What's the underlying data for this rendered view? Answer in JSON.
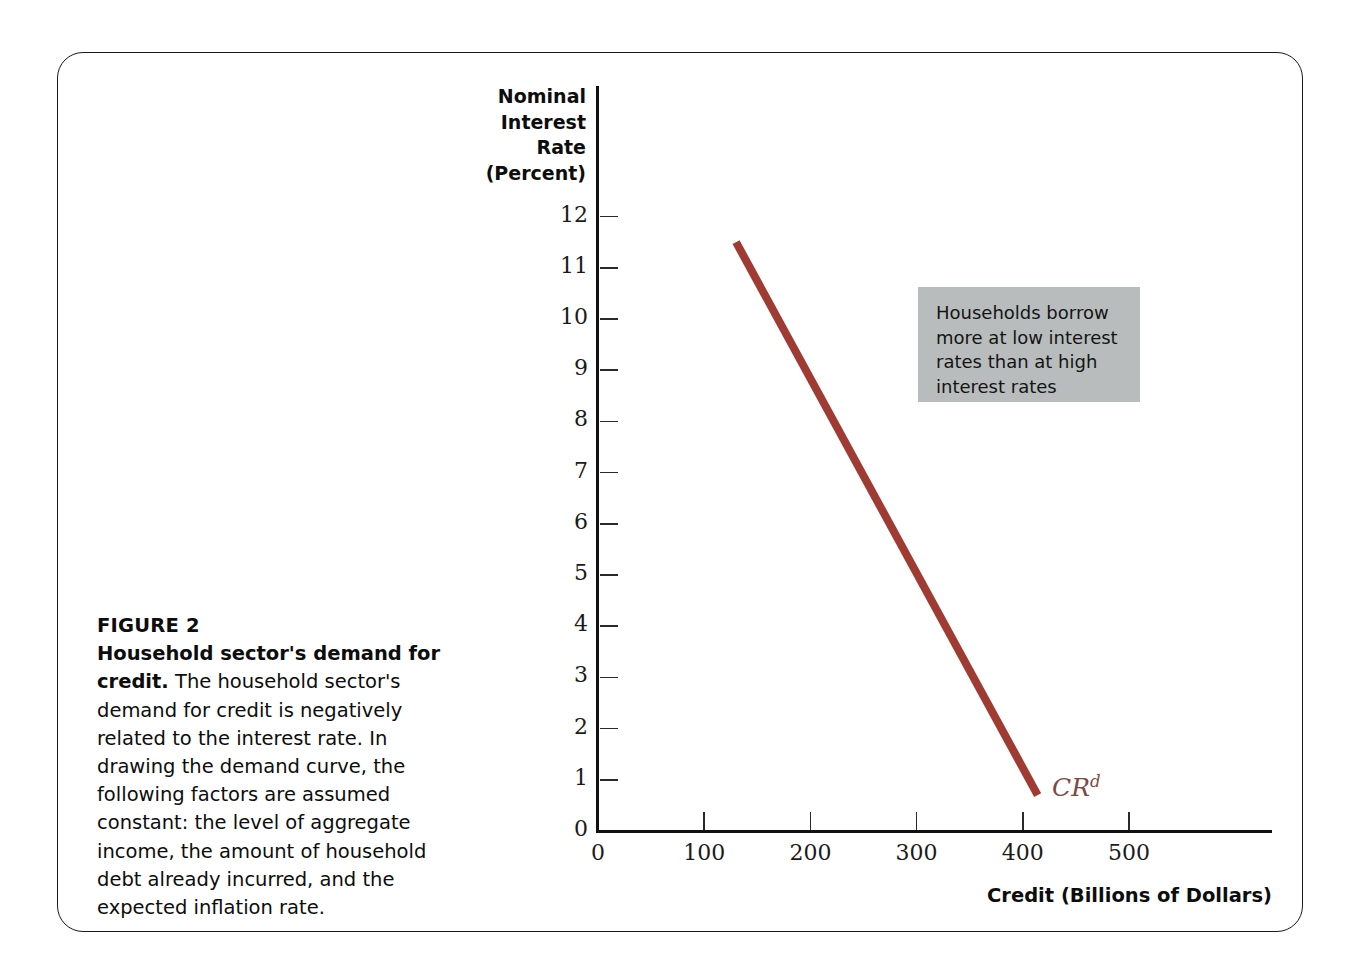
{
  "figure": {
    "number_label": "FIGURE 2",
    "caption_lead": "Household sector's demand for credit.",
    "caption_body": " The household sector's demand for credit is negatively related to the interest rate. In drawing the demand curve, the following factors are assumed constant: the level of aggregate income, the amount of household debt already incurred, and the expected inflation rate."
  },
  "callout": {
    "text": "Households borrow more at low interest rates than at high interest rates",
    "background_color": "#b9bcbd"
  },
  "curve": {
    "label_main": "CR",
    "label_superscript": "d",
    "color": "#9e3b33",
    "label_color": "#7d4a46"
  },
  "chart_data": {
    "type": "line",
    "title": "Household sector's demand for credit",
    "xlabel": "Credit (Billions of Dollars)",
    "ylabel": "Nominal Interest Rate (Percent)",
    "ylabel_lines": [
      "Nominal",
      "Interest",
      "Rate",
      "(Percent)"
    ],
    "xlim": [
      0,
      635
    ],
    "ylim": [
      0,
      12.9
    ],
    "xticks": [
      0,
      100,
      200,
      300,
      400,
      500
    ],
    "xtick_labels": [
      "0",
      "100",
      "200",
      "300",
      "400",
      "500"
    ],
    "yticks": [
      0,
      1,
      2,
      3,
      4,
      5,
      6,
      7,
      8,
      9,
      10,
      11,
      12
    ],
    "ytick_labels": [
      "0",
      "1",
      "2",
      "3",
      "4",
      "5",
      "6",
      "7",
      "8",
      "9",
      "10",
      "11",
      "12"
    ],
    "grid": false,
    "legend": false,
    "series": [
      {
        "name": "CR d",
        "label": "CR^d",
        "color": "#9e3b33",
        "linewidth": 8,
        "x": [
          130,
          414
        ],
        "values": [
          11.5,
          0.7
        ]
      }
    ],
    "annotations": [
      {
        "text": "Households borrow more at low interest rates than at high interest rates",
        "x_data": 305,
        "y_data": 9.7,
        "style": "gray-box"
      },
      {
        "text": "CR^d",
        "x_data": 428,
        "y_data": 0.85,
        "style": "curve-label"
      }
    ]
  }
}
